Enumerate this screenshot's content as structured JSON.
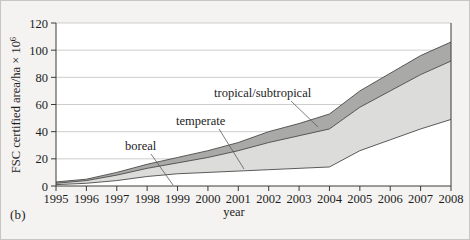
{
  "figure": {
    "panel_label": "(b)",
    "background_color": "#f4f3f1",
    "plot_background_color": "#ffffff",
    "frame_color": "#c8c6c2"
  },
  "chart_data": {
    "type": "area",
    "stacked": true,
    "title": "",
    "xlabel": "year",
    "ylabel": "FSC certified area/ha × 10",
    "ylabel_exponent": "6",
    "ylabel_full": "FSC certified area/ha × 10⁶",
    "grid": true,
    "grid_axis": "y",
    "legend_position": "inline-annotations",
    "xlim": [
      1995,
      2008
    ],
    "ylim": [
      0,
      120
    ],
    "yticks": [
      0,
      20,
      40,
      60,
      80,
      100,
      120
    ],
    "ytick_labels": [
      "0",
      "20",
      "40",
      "60",
      "80",
      "100",
      "120"
    ],
    "categories": [
      1995,
      1996,
      1997,
      1998,
      1999,
      2000,
      2001,
      2002,
      2003,
      2004,
      2005,
      2006,
      2007,
      2008
    ],
    "xtick_labels": [
      "1995",
      "1996",
      "1997",
      "1998",
      "1999",
      "2000",
      "2001",
      "2002",
      "2003",
      "2004",
      "2005",
      "2006",
      "2007",
      "2008"
    ],
    "series": [
      {
        "name": "boreal",
        "label": "boreal",
        "color": "#ffffff",
        "values": [
          1,
          2,
          4,
          7,
          9,
          10,
          11,
          12,
          13,
          14,
          26,
          34,
          42,
          49
        ]
      },
      {
        "name": "temperate",
        "label": "temperate",
        "color": "#dcdcda",
        "values": [
          1,
          2,
          4,
          6,
          8,
          11,
          15,
          20,
          24,
          28,
          32,
          36,
          40,
          43
        ]
      },
      {
        "name": "tropical/subtropical",
        "label": "tropical/subtropical",
        "color": "#a9a9a7",
        "values": [
          1,
          1,
          2,
          3,
          4,
          5,
          6,
          8,
          9,
          11,
          12,
          13,
          14,
          14
        ]
      }
    ],
    "cumulative_top_values": [
      3,
      5,
      10,
      16,
      21,
      26,
      32,
      40,
      46,
      53,
      70,
      83,
      96,
      106
    ],
    "annotations": [
      {
        "text": "boreal",
        "x_px": 124,
        "y_px": 149
      },
      {
        "text": "temperate",
        "x_px": 175,
        "y_px": 124
      },
      {
        "text": "tropical/subtropical",
        "x_px": 213,
        "y_px": 96
      }
    ]
  }
}
